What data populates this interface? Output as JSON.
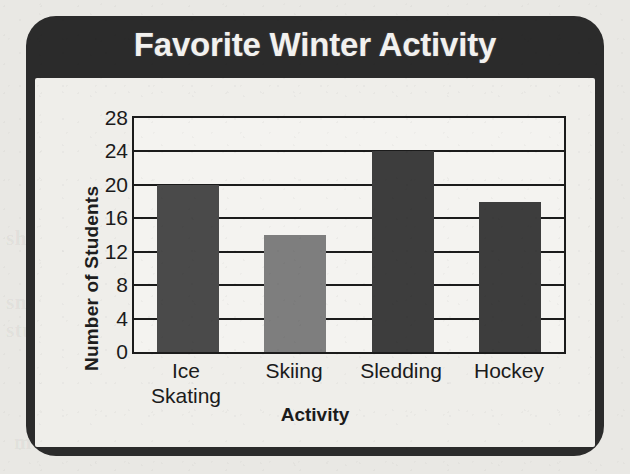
{
  "chart_data": {
    "type": "bar",
    "title": "Favorite Winter Activity",
    "xlabel": "Activity",
    "ylabel": "Number of Students",
    "categories": [
      "Ice Skating",
      "Skiing",
      "Sledding",
      "Hockey"
    ],
    "category_lines": [
      [
        "Ice",
        "Skating"
      ],
      [
        "Skiing"
      ],
      [
        "Sledding"
      ],
      [
        "Hockey"
      ]
    ],
    "values": [
      20,
      14,
      24,
      18
    ],
    "ylim": [
      0,
      28
    ],
    "yticks": [
      0,
      4,
      8,
      12,
      16,
      20,
      24,
      28
    ],
    "ytick_labels": [
      "0",
      "4",
      "8",
      "12",
      "16",
      "20",
      "24",
      "28"
    ],
    "grid": true,
    "legend": false,
    "bar_colors": [
      "#4a4a4a",
      "#7e7e7e",
      "#3d3d3d",
      "#3d3d3d"
    ]
  },
  "colors": {
    "frame": "#2b2b2b",
    "title_text": "#f2f1ef",
    "plot_background": "#f4f3f0",
    "axis": "#1b1b1b",
    "page_background": "#e9e8e4",
    "bar_dark": "#3d3d3d",
    "bar_medium_dark": "#4a4a4a",
    "bar_light": "#7e7e7e"
  },
  "bleed_through": {
    "line1": "blank text",
    "line2": "shown",
    "line3": "snow",
    "line4": "students",
    "line5": "mountain"
  }
}
